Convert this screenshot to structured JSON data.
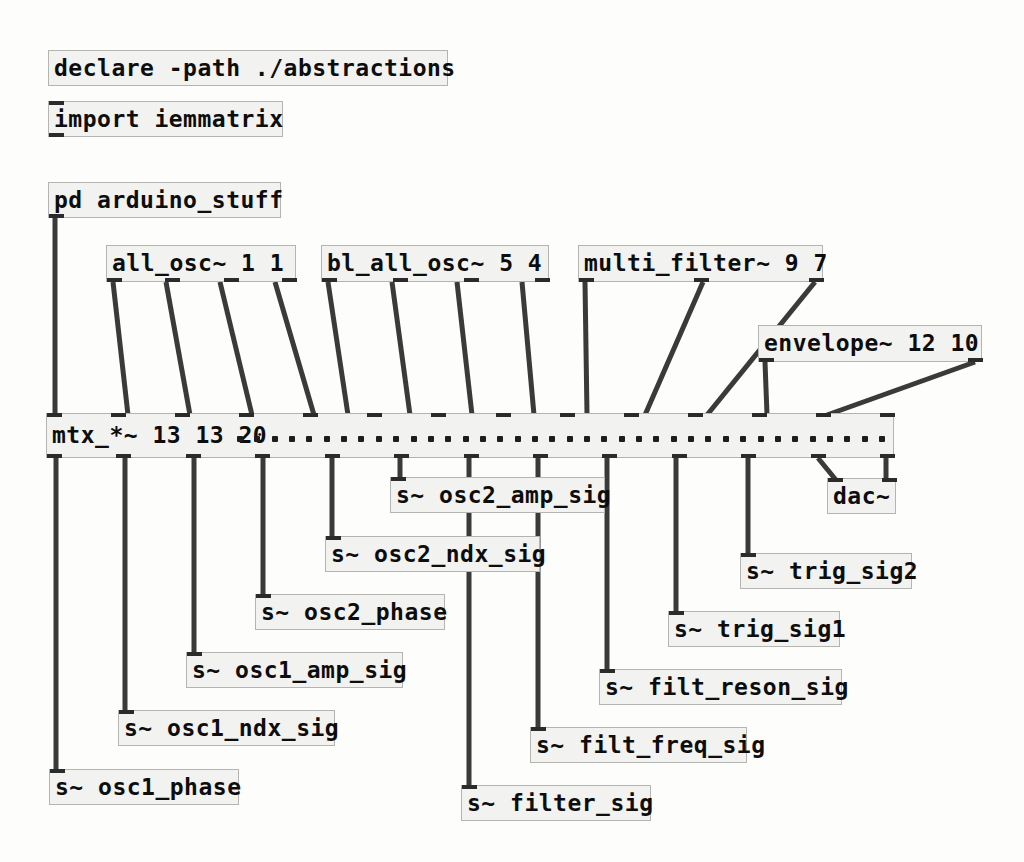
{
  "patch": {
    "title": "Pure Data patch window",
    "background_color": "#fdfdfc",
    "object_fill": "#f2f2f0",
    "object_border": "#b4b4b0",
    "text_color": "#0d0d0d",
    "wire_color": "#3a3a3a"
  },
  "objects": [
    {
      "id": "declare",
      "name": "declare-object",
      "text": "declare -path ./abstractions",
      "x": 48,
      "y": 50,
      "w": 400,
      "h": 36,
      "fontsize": 23,
      "inlets": 0,
      "outlets": 0
    },
    {
      "id": "import",
      "name": "import-object",
      "text": "import iemmatrix",
      "x": 48,
      "y": 101,
      "w": 235,
      "h": 36,
      "fontsize": 23,
      "inlets": 1,
      "outlets": 1
    },
    {
      "id": "pd_arduino",
      "name": "pd-subpatch-arduino-stuff",
      "text": "pd arduino_stuff",
      "x": 48,
      "y": 182,
      "w": 233,
      "h": 36,
      "fontsize": 23,
      "inlets": 0,
      "outlets": 1
    },
    {
      "id": "all_osc",
      "name": "all-osc-object",
      "text": "all_osc~ 1 1",
      "x": 106,
      "y": 245,
      "w": 190,
      "h": 37,
      "fontsize": 23,
      "inlets": 0,
      "outlets": 4
    },
    {
      "id": "bl_all_osc",
      "name": "bl-all-osc-object",
      "text": "bl_all_osc~ 5 4",
      "x": 321,
      "y": 245,
      "w": 228,
      "h": 37,
      "fontsize": 23,
      "inlets": 0,
      "outlets": 4
    },
    {
      "id": "multi_filter",
      "name": "multi-filter-object",
      "text": "multi_filter~ 9 7",
      "x": 578,
      "y": 245,
      "w": 245,
      "h": 37,
      "fontsize": 23,
      "inlets": 0,
      "outlets": 3
    },
    {
      "id": "envelope",
      "name": "envelope-object",
      "text": "envelope~ 12 10",
      "x": 758,
      "y": 325,
      "w": 224,
      "h": 37,
      "fontsize": 23,
      "inlets": 0,
      "outlets": 2
    },
    {
      "id": "mtx",
      "name": "mtx-multiply-matrix-object",
      "text": "mtx_*~ 13 13 20",
      "x": 46,
      "y": 413,
      "w": 848,
      "h": 45,
      "fontsize": 23,
      "inlets": 14,
      "outlets": 13,
      "dots": 38,
      "dots_start": 190
    },
    {
      "id": "dac",
      "name": "dac-output-object",
      "text": "dac~",
      "x": 827,
      "y": 478,
      "w": 69,
      "h": 36,
      "fontsize": 23,
      "inlets": 2,
      "outlets": 0
    }
  ],
  "sends": [
    {
      "id": "s_osc2_amp",
      "name": "send-osc2-amp-sig",
      "text": "s~ osc2_amp_sig",
      "x": 390,
      "y": 477,
      "w": 215,
      "h": 36,
      "fontsize": 23
    },
    {
      "id": "s_osc2_ndx",
      "name": "send-osc2-ndx-sig",
      "text": "s~ osc2_ndx_sig",
      "x": 325,
      "y": 536,
      "w": 215,
      "h": 36,
      "fontsize": 23
    },
    {
      "id": "s_osc2_phase",
      "name": "send-osc2-phase",
      "text": "s~ osc2_phase",
      "x": 255,
      "y": 594,
      "w": 190,
      "h": 36,
      "fontsize": 23
    },
    {
      "id": "s_osc1_amp",
      "name": "send-osc1-amp-sig",
      "text": "s~ osc1_amp_sig",
      "x": 186,
      "y": 652,
      "w": 217,
      "h": 36,
      "fontsize": 23
    },
    {
      "id": "s_osc1_ndx",
      "name": "send-osc1-ndx-sig",
      "text": "s~ osc1_ndx_sig",
      "x": 118,
      "y": 710,
      "w": 217,
      "h": 36,
      "fontsize": 23
    },
    {
      "id": "s_osc1_phase",
      "name": "send-osc1-phase",
      "text": "s~ osc1_phase",
      "x": 49,
      "y": 769,
      "w": 190,
      "h": 36,
      "fontsize": 23
    },
    {
      "id": "s_filter",
      "name": "send-filter-sig",
      "text": "s~ filter_sig",
      "x": 461,
      "y": 785,
      "w": 190,
      "h": 36,
      "fontsize": 23
    },
    {
      "id": "s_filt_freq",
      "name": "send-filt-freq-sig",
      "text": "s~ filt_freq_sig",
      "x": 530,
      "y": 727,
      "w": 217,
      "h": 36,
      "fontsize": 23
    },
    {
      "id": "s_filt_reson",
      "name": "send-filt-reson-sig",
      "text": "s~ filt_reson_sig",
      "x": 599,
      "y": 669,
      "w": 243,
      "h": 36,
      "fontsize": 23
    },
    {
      "id": "s_trig1",
      "name": "send-trig-sig1",
      "text": "s~ trig_sig1",
      "x": 668,
      "y": 611,
      "w": 172,
      "h": 36,
      "fontsize": 23
    },
    {
      "id": "s_trig2",
      "name": "send-trig-sig2",
      "text": "s~ trig_sig2",
      "x": 740,
      "y": 553,
      "w": 172,
      "h": 36,
      "fontsize": 23
    }
  ],
  "wires": [
    {
      "name": "wire-pd-arduino-to-mtx-in0",
      "x1": 55,
      "y1": 218,
      "x2": 55,
      "y2": 415
    },
    {
      "name": "wire-allosc-out0-to-mtx",
      "x1": 113,
      "y1": 282,
      "x2": 128,
      "y2": 415
    },
    {
      "name": "wire-allosc-out1-to-mtx",
      "x1": 166,
      "y1": 282,
      "x2": 190,
      "y2": 415
    },
    {
      "name": "wire-allosc-out2-to-mtx",
      "x1": 220,
      "y1": 282,
      "x2": 252,
      "y2": 415
    },
    {
      "name": "wire-allosc-out3-to-mtx",
      "x1": 275,
      "y1": 282,
      "x2": 314,
      "y2": 415
    },
    {
      "name": "wire-blallosc-out0-to-mtx",
      "x1": 328,
      "y1": 282,
      "x2": 348,
      "y2": 415
    },
    {
      "name": "wire-blallosc-out1-to-mtx",
      "x1": 392,
      "y1": 282,
      "x2": 410,
      "y2": 415
    },
    {
      "name": "wire-blallosc-out2-to-mtx",
      "x1": 457,
      "y1": 282,
      "x2": 472,
      "y2": 415
    },
    {
      "name": "wire-blallosc-out3-to-mtx",
      "x1": 522,
      "y1": 282,
      "x2": 534,
      "y2": 415
    },
    {
      "name": "wire-multifilter-out0-to-mtx",
      "x1": 585,
      "y1": 282,
      "x2": 587,
      "y2": 415
    },
    {
      "name": "wire-multifilter-out1-to-mtx",
      "x1": 703,
      "y1": 282,
      "x2": 645,
      "y2": 415
    },
    {
      "name": "wire-multifilter-out2-to-mtx",
      "x1": 815,
      "y1": 282,
      "x2": 707,
      "y2": 415
    },
    {
      "name": "wire-envelope-out0-to-mtx",
      "x1": 765,
      "y1": 362,
      "x2": 767,
      "y2": 415
    },
    {
      "name": "wire-envelope-out1-to-mtx",
      "x1": 975,
      "y1": 362,
      "x2": 827,
      "y2": 415
    },
    {
      "name": "wire-mtx-out0-to-osc1-phase",
      "x1": 56,
      "y1": 458,
      "x2": 56,
      "y2": 771
    },
    {
      "name": "wire-mtx-out1-to-osc1-ndx",
      "x1": 125,
      "y1": 458,
      "x2": 125,
      "y2": 712
    },
    {
      "name": "wire-mtx-out2-to-osc1-amp",
      "x1": 194,
      "y1": 458,
      "x2": 194,
      "y2": 654
    },
    {
      "name": "wire-mtx-out3-to-osc2-phase",
      "x1": 263,
      "y1": 458,
      "x2": 263,
      "y2": 596
    },
    {
      "name": "wire-mtx-out4-to-osc2-ndx",
      "x1": 332,
      "y1": 458,
      "x2": 332,
      "y2": 538
    },
    {
      "name": "wire-mtx-out5-to-osc2-amp",
      "x1": 400,
      "y1": 458,
      "x2": 400,
      "y2": 479
    },
    {
      "name": "wire-mtx-out6-to-filter-sig",
      "x1": 469,
      "y1": 458,
      "x2": 469,
      "y2": 787
    },
    {
      "name": "wire-mtx-out7-to-filt-freq",
      "x1": 538,
      "y1": 458,
      "x2": 538,
      "y2": 729
    },
    {
      "name": "wire-mtx-out8-to-filt-reson",
      "x1": 607,
      "y1": 458,
      "x2": 607,
      "y2": 671
    },
    {
      "name": "wire-mtx-out9-to-trig1",
      "x1": 676,
      "y1": 458,
      "x2": 676,
      "y2": 613
    },
    {
      "name": "wire-mtx-out10-to-trig2",
      "x1": 748,
      "y1": 458,
      "x2": 748,
      "y2": 555
    },
    {
      "name": "wire-mtx-out11-to-dac-left",
      "x1": 818,
      "y1": 458,
      "x2": 836,
      "y2": 480
    },
    {
      "name": "wire-mtx-out12-to-dac-right",
      "x1": 886,
      "y1": 458,
      "x2": 886,
      "y2": 480
    }
  ]
}
